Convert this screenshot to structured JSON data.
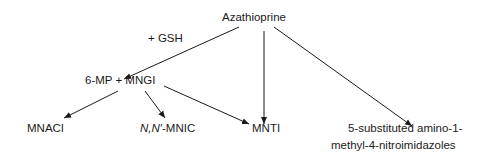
{
  "diagram": {
    "nodes": {
      "azathioprine": "Azathioprine",
      "reagent": "+ GSH",
      "intermediate": "6-MP + MNGI",
      "mnaci": "MNACI",
      "mnic_italic": "N,N′",
      "mnic_rest": "-MNIC",
      "mnti": "MNTI",
      "nitroimidazoles_line1": "5-substituted amino-1-",
      "nitroimidazoles_line2": "methyl-4-nitroimidazoles"
    },
    "edges": [
      {
        "from": "Azathioprine",
        "to": "6-MP + MNGI",
        "label": "+ GSH"
      },
      {
        "from": "Azathioprine",
        "to": "MNTI"
      },
      {
        "from": "Azathioprine",
        "to": "5-substituted amino-1-methyl-4-nitroimidazoles"
      },
      {
        "from": "6-MP + MNGI",
        "to": "MNACI"
      },
      {
        "from": "6-MP + MNGI",
        "to": "N,N′-MNIC"
      },
      {
        "from": "6-MP + MNGI",
        "to": "MNTI"
      }
    ],
    "colors": {
      "line": "#1a1a1a",
      "background": "#ffffff"
    }
  }
}
